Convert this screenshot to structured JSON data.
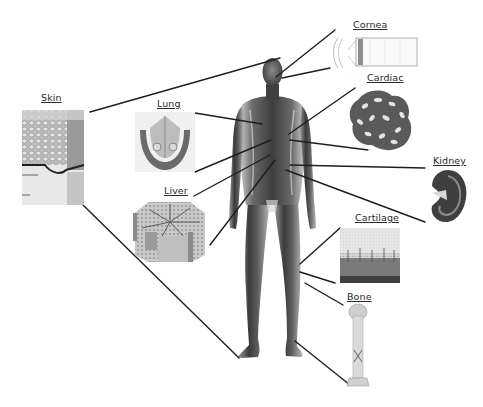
{
  "diagram": {
    "colors": {
      "line": "#1e1e1e",
      "body_dark": "#2b2b2b",
      "body_mid": "#7a7a7a",
      "body_light": "#d0d0d0",
      "label_text": "#2a2a2a"
    },
    "labels": {
      "skin": "Skin",
      "lung": "Lung",
      "liver": "Liver",
      "cornea": "Cornea",
      "cardiac": "Cardiac",
      "kidney": "Kidney",
      "cartilage": "Cartilage",
      "bone": "Bone"
    },
    "tissues": [
      {
        "id": "skin",
        "side": "left",
        "connects_to": "upper body"
      },
      {
        "id": "lung",
        "side": "left",
        "connects_to": "chest"
      },
      {
        "id": "liver",
        "side": "left",
        "connects_to": "abdomen"
      },
      {
        "id": "cornea",
        "side": "right",
        "connects_to": "eye"
      },
      {
        "id": "cardiac",
        "side": "right",
        "connects_to": "heart"
      },
      {
        "id": "kidney",
        "side": "right",
        "connects_to": "lower back"
      },
      {
        "id": "cartilage",
        "side": "right",
        "connects_to": "knee"
      },
      {
        "id": "bone",
        "side": "right",
        "connects_to": "leg / foot"
      }
    ]
  }
}
